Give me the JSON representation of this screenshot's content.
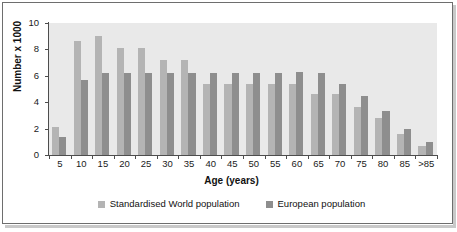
{
  "chart_data": {
    "type": "bar",
    "title": "",
    "xlabel": "Age (years)",
    "ylabel": "Number x 1000",
    "categories": [
      "5",
      "10",
      "15",
      "20",
      "25",
      "30",
      "35",
      "40",
      "45",
      "50",
      "55",
      "60",
      "65",
      "70",
      "75",
      "80",
      "85",
      ">85"
    ],
    "ylim": [
      0,
      10
    ],
    "yticks": [
      0,
      2,
      4,
      6,
      8,
      10
    ],
    "ytick_labels": [
      "0",
      "2",
      "4",
      "6",
      "8",
      "10"
    ],
    "grid": false,
    "legend_position": "bottom",
    "series": [
      {
        "name": "Standardised World population",
        "color": "#b4b4b4",
        "values": [
          2.1,
          8.6,
          9.0,
          8.1,
          8.1,
          7.2,
          7.2,
          5.4,
          5.4,
          5.4,
          5.4,
          5.4,
          4.6,
          4.6,
          3.6,
          2.8,
          1.6,
          0.7
        ]
      },
      {
        "name": "European population",
        "color": "#8e8e8e",
        "values": [
          1.4,
          5.7,
          6.2,
          6.2,
          6.2,
          6.2,
          6.2,
          6.2,
          6.2,
          6.2,
          6.2,
          6.3,
          6.2,
          5.4,
          4.5,
          3.3,
          2.0,
          1.0
        ]
      }
    ]
  },
  "legend": {
    "items": [
      {
        "label": "Standardised World population",
        "color": "#b4b4b4"
      },
      {
        "label": "European population",
        "color": "#8e8e8e"
      }
    ]
  }
}
